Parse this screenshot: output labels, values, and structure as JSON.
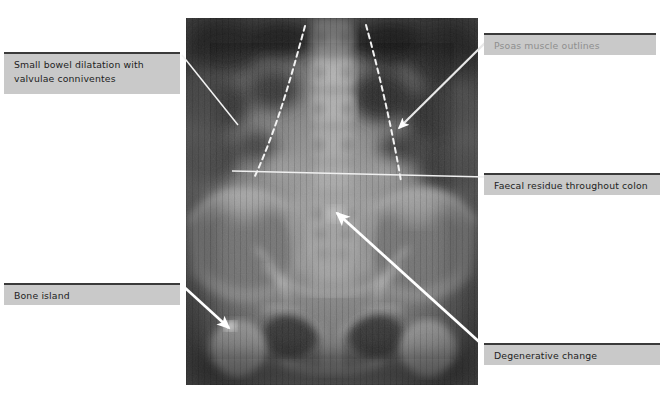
{
  "figure": {
    "image": {
      "name": "abdominal-pelvic-xray",
      "modality": "plain radiograph",
      "region": "abdomen and pelvis",
      "x": 186,
      "y": 18,
      "width": 292,
      "height": 367
    }
  },
  "annotations": [
    {
      "id": "small-bowel",
      "text": "Small bowel dilatation with\nvalvulae conniventes",
      "style": "dark",
      "marker": "line",
      "box": {
        "x": 4,
        "y": 52,
        "width": 176,
        "height": 42
      },
      "leader": {
        "from_x": 180,
        "from_y": 54,
        "to_x": 240,
        "to_y": 126
      }
    },
    {
      "id": "psoas",
      "text": "Psoas muscle outlines",
      "style": "muted",
      "marker": "arrow",
      "box": {
        "x": 484,
        "y": 33,
        "width": 172,
        "height": 22
      },
      "leader": {
        "from_x": 490,
        "from_y": 35,
        "to_x": 398,
        "to_y": 128
      }
    },
    {
      "id": "faecal",
      "text": "Faecal residue throughout colon",
      "style": "dark",
      "marker": "line",
      "box": {
        "x": 484,
        "y": 173,
        "width": 176,
        "height": 22
      },
      "leader": {
        "from_x": 484,
        "from_y": 176,
        "to_x": 232,
        "to_y": 172
      }
    },
    {
      "id": "bone-island",
      "text": "Bone island",
      "style": "dark",
      "marker": "arrow",
      "box": {
        "x": 4,
        "y": 283,
        "width": 176,
        "height": 22
      },
      "leader": {
        "from_x": 182,
        "from_y": 285,
        "to_x": 228,
        "to_y": 327
      }
    },
    {
      "id": "degenerative",
      "text": "Degenerative change",
      "style": "dark",
      "marker": "arrow",
      "box": {
        "x": 484,
        "y": 343,
        "width": 176,
        "height": 22
      },
      "leader": {
        "from_x": 484,
        "from_y": 346,
        "to_x": 336,
        "to_y": 212
      }
    }
  ],
  "overlays": {
    "psoas_outline_left": "dashed white line from (305,26) to (255,176)",
    "psoas_outline_right": "dashed white line from (366,25) to (401,181)"
  },
  "colors": {
    "label_background": "#c9c9c9",
    "label_border_top": "#3a3a3a",
    "label_text_dark": "#1d1d1d",
    "label_text_muted": "#8e8e8e",
    "leader_line": "#ffffff",
    "page_background": "#ffffff"
  }
}
